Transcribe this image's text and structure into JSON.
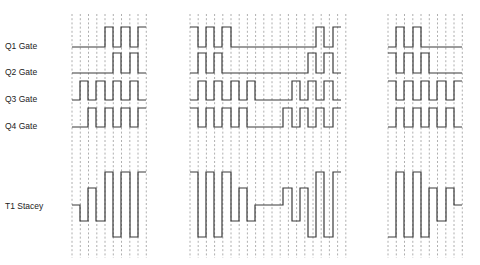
{
  "diagram": {
    "type": "timing-diagram",
    "colors": {
      "background": "#ffffff",
      "trace": "#3a3a3a",
      "grid": "#9a9a9a",
      "label": "#222222"
    },
    "signals": [
      {
        "id": "q1",
        "label": "Q1 Gate",
        "label_y": 48
      },
      {
        "id": "q2",
        "label": "Q2 Gate",
        "label_y": 74
      },
      {
        "id": "q3",
        "label": "Q3 Gate",
        "label_y": 101
      },
      {
        "id": "q4",
        "label": "Q4 Gate",
        "label_y": 128
      },
      {
        "id": "t1",
        "label": "T1 Stacey",
        "label_y": 208
      }
    ],
    "panels": [
      {
        "id": "left",
        "grid_x_start": 72,
        "grid_step": 8.25,
        "grid_count": 10,
        "traces": {
          "q1": "M72,47 H105 V27 H113 V47 H121 V27 H130 V47 H138 V27 H146",
          "q2": "M72,73 H113 V53 H121 V73 H130 V53 H138 V73 H146",
          "q3": "M72,100 H80 V81 H88 V100 H96 V81 H105 V100 H113 V81 H121 V100 H130 V81 H138 V100 H146",
          "q4": "M72,127 H88 V108 H96 V127 H105 V108 H113 V127 H121 V108 H130 V127 H138 V108 H146",
          "t1": "M72,205 H80 V221 H88 V188 H96 V221 H105 V172 H113 V237 H121 V172 H130 V237 H138 V172 H146"
        }
      },
      {
        "id": "middle",
        "grid_x_start": 190,
        "grid_step": 8.2,
        "grid_count": 20,
        "traces": {
          "q1": "M190,27 H198 V47 H206 V27 H214 V47 H222 V27 H231 V47 H316 V27 H324 V47 H333 V27 H341",
          "q2": "M190,73 H198 V53 H206 V73 H214 V53 H222 V73 H308 V53 H316 V73 H324 V53 H333 V73 H341",
          "q3": "M190,100 H198 V81 H206 V100 H214 V81 H222 V100 H231 V81 H239 V100 H247 V81 H255 V100 H292 V81 H300 V100 H308 V81 H316 V100 H324 V81 H333 V100 H341",
          "q4": "M190,108 H198 V127 H206 V108 H214 V127 H222 V108 H231 V127 H239 V108 H247 V127 H283 V108 H292 V127 H300 V108 H308 V127 H316 V108 H324 V127 H333 V108 H341",
          "t1": "M190,172 H198 V237 H206 V172 H214 V237 H222 V172 H231 V221 H239 V188 H247 V221 H255 V205 H283 V188 H292 V221 H300 V188 H308 V237 H316 V172 H324 V237 H333 V172 H341"
        }
      },
      {
        "id": "right",
        "grid_x_start": 388,
        "grid_step": 8.25,
        "grid_count": 10,
        "traces": {
          "q1": "M388,47 H396 V27 H404 V47 H413 V27 H421 V47 H462",
          "q2": "M388,53 H396 V73 H404 V53 H413 V73 H421 V53 H429 V73 H462",
          "q3": "M388,81 H396 V100 H404 V81 H413 V100 H421 V81 H429 V100 H437 V81 H446 V100 H454 V81 H462",
          "q4": "M388,127 H396 V108 H404 V127 H413 V108 H421 V127 H429 V108 H437 V127 H446 V108 H454 V127 H462",
          "t1": "M388,237 H396 V172 H404 V237 H413 V172 H421 V237 H429 V188 H437 V221 H446 V188 H454 V205 H462"
        }
      }
    ]
  }
}
